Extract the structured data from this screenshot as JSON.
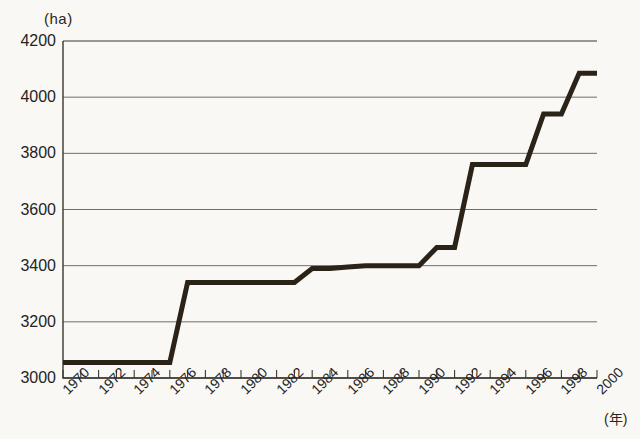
{
  "chart_data": {
    "type": "line",
    "title": "",
    "subtitle": "",
    "xlabel": "(年)",
    "ylabel": "(ha)",
    "xlim": [
      1970,
      2000
    ],
    "ylim": [
      3000,
      4200
    ],
    "grid": true,
    "legend": null,
    "y_ticks": [
      4200,
      4000,
      3800,
      3600,
      3400,
      3200,
      3000
    ],
    "y_tick_labels": [
      "4200",
      "4000",
      "3800",
      "3600",
      "3400",
      "3200",
      "3000"
    ],
    "x_ticks": [
      1970,
      1971,
      1972,
      1973,
      1974,
      1975,
      1976,
      1977,
      1978,
      1979,
      1980,
      1981,
      1982,
      1983,
      1984,
      1985,
      1986,
      1987,
      1988,
      1989,
      1990,
      1991,
      1992,
      1993,
      1994,
      1995,
      1996,
      1997,
      1998,
      1999,
      2000
    ],
    "x_tick_labels": [
      "1970",
      "",
      "1972",
      "",
      "1974",
      "",
      "1976",
      "",
      "1978",
      "",
      "1980",
      "",
      "1982",
      "",
      "1984",
      "",
      "1986",
      "",
      "1988",
      "",
      "1990",
      "",
      "1992",
      "",
      "1994",
      "",
      "1996",
      "",
      "1998",
      "",
      "2000"
    ],
    "series": [
      {
        "name": "面積",
        "color": "#2b2318",
        "x": [
          1970,
          1971,
          1972,
          1973,
          1974,
          1975,
          1976,
          1977,
          1978,
          1979,
          1980,
          1981,
          1982,
          1983,
          1984,
          1985,
          1986,
          1987,
          1988,
          1989,
          1990,
          1991,
          1992,
          1993,
          1994,
          1995,
          1996,
          1997,
          1998,
          1999,
          2000
        ],
        "values": [
          3055,
          3055,
          3055,
          3055,
          3055,
          3055,
          3055,
          3340,
          3340,
          3340,
          3340,
          3340,
          3340,
          3340,
          3390,
          3390,
          3395,
          3400,
          3400,
          3400,
          3400,
          3465,
          3465,
          3760,
          3760,
          3760,
          3760,
          3940,
          3940,
          4085,
          4085
        ]
      }
    ]
  },
  "axes": {
    "y_unit_label": "(ha)",
    "x_unit_label": "(年)"
  },
  "colors": {
    "background": "#faf8f4",
    "line": "#2b2318",
    "grid": "#6e6e68",
    "axis": "#3a3730",
    "text": "#26231e"
  }
}
